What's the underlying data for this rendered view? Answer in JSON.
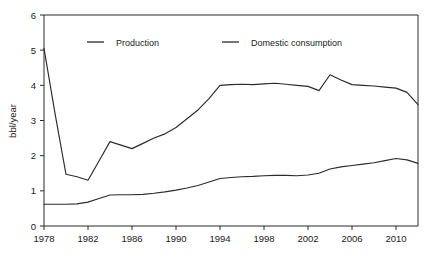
{
  "chart_data": {
    "type": "line",
    "title": "",
    "xlabel": "",
    "ylabel": "bbl/year",
    "xlim": [
      1978,
      2012
    ],
    "ylim": [
      0,
      6
    ],
    "grid": false,
    "legend_position": "top-center",
    "x_ticks": [
      1978,
      1982,
      1986,
      1990,
      1994,
      1998,
      2002,
      2006,
      2010
    ],
    "y_ticks": [
      0,
      1,
      2,
      3,
      4,
      5,
      6
    ],
    "x": [
      1978,
      1979,
      1980,
      1981,
      1982,
      1983,
      1984,
      1985,
      1986,
      1987,
      1988,
      1989,
      1990,
      1991,
      1992,
      1993,
      1994,
      1995,
      1996,
      1997,
      1998,
      1999,
      2000,
      2001,
      2002,
      2003,
      2004,
      2005,
      2006,
      2007,
      2008,
      2009,
      2010,
      2011,
      2012
    ],
    "series": [
      {
        "name": "Production",
        "color": "#2b2b2b",
        "values": [
          5.05,
          3.2,
          1.47,
          1.4,
          1.3,
          1.85,
          2.4,
          2.3,
          2.2,
          2.35,
          2.5,
          2.62,
          2.8,
          3.05,
          3.3,
          3.62,
          4.0,
          4.02,
          4.03,
          4.02,
          4.04,
          4.06,
          4.03,
          4.0,
          3.97,
          3.85,
          4.3,
          4.15,
          4.02,
          4.0,
          3.98,
          3.95,
          3.92,
          3.8,
          3.45
        ]
      },
      {
        "name": "Domestic consumption",
        "color": "#2b2b2b",
        "values": [
          0.62,
          0.62,
          0.62,
          0.63,
          0.68,
          0.78,
          0.88,
          0.89,
          0.89,
          0.9,
          0.93,
          0.97,
          1.02,
          1.08,
          1.15,
          1.25,
          1.35,
          1.38,
          1.4,
          1.41,
          1.43,
          1.44,
          1.44,
          1.43,
          1.45,
          1.5,
          1.62,
          1.68,
          1.72,
          1.76,
          1.8,
          1.86,
          1.92,
          1.88,
          1.78
        ]
      }
    ]
  },
  "legend": {
    "items": [
      {
        "label": "Production"
      },
      {
        "label": "Domestic consumption"
      }
    ]
  }
}
